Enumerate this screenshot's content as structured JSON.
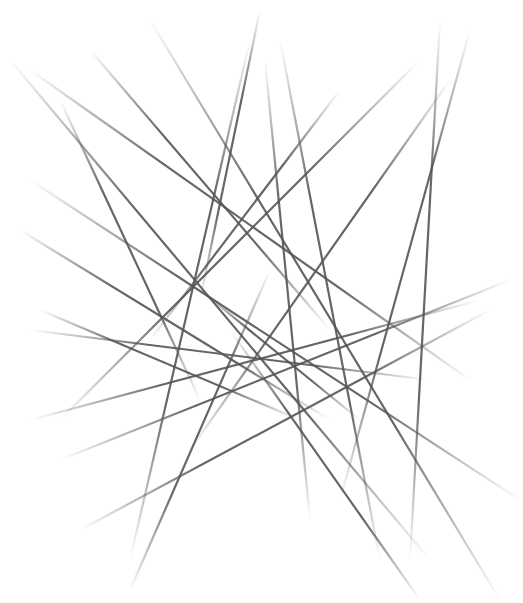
{
  "artwork": {
    "description": "Abstract crossing lines",
    "background": "#ffffff",
    "stroke_color": "#555555",
    "stroke_width": 2.2,
    "lines": [
      {
        "x1": 10,
        "y1": 60,
        "x2": 430,
        "y2": 560,
        "fade": "both"
      },
      {
        "x1": 60,
        "y1": 100,
        "x2": 200,
        "y2": 400,
        "fade": "both"
      },
      {
        "x1": 30,
        "y1": 70,
        "x2": 470,
        "y2": 380,
        "fade": "both"
      },
      {
        "x1": 150,
        "y1": 20,
        "x2": 500,
        "y2": 600,
        "fade": "both"
      },
      {
        "x1": 90,
        "y1": 50,
        "x2": 330,
        "y2": 330,
        "fade": "both"
      },
      {
        "x1": 250,
        "y1": 40,
        "x2": 130,
        "y2": 560,
        "fade": "both"
      },
      {
        "x1": 260,
        "y1": 10,
        "x2": 200,
        "y2": 300,
        "fade": "both"
      },
      {
        "x1": 280,
        "y1": 40,
        "x2": 380,
        "y2": 560,
        "fade": "both"
      },
      {
        "x1": 265,
        "y1": 60,
        "x2": 310,
        "y2": 520,
        "fade": "both"
      },
      {
        "x1": 440,
        "y1": 20,
        "x2": 410,
        "y2": 560,
        "fade": "both"
      },
      {
        "x1": 470,
        "y1": 30,
        "x2": 340,
        "y2": 500,
        "fade": "both"
      },
      {
        "x1": 450,
        "y1": 80,
        "x2": 190,
        "y2": 450,
        "fade": "both"
      },
      {
        "x1": 420,
        "y1": 60,
        "x2": 60,
        "y2": 420,
        "fade": "both"
      },
      {
        "x1": 340,
        "y1": 90,
        "x2": 150,
        "y2": 340,
        "fade": "both"
      },
      {
        "x1": 30,
        "y1": 330,
        "x2": 430,
        "y2": 380,
        "fade": "both"
      },
      {
        "x1": 30,
        "y1": 420,
        "x2": 480,
        "y2": 300,
        "fade": "both"
      },
      {
        "x1": 60,
        "y1": 460,
        "x2": 510,
        "y2": 280,
        "fade": "both"
      },
      {
        "x1": 80,
        "y1": 530,
        "x2": 490,
        "y2": 310,
        "fade": "both"
      },
      {
        "x1": 20,
        "y1": 230,
        "x2": 330,
        "y2": 420,
        "fade": "both"
      },
      {
        "x1": 30,
        "y1": 180,
        "x2": 520,
        "y2": 500,
        "fade": "both"
      },
      {
        "x1": 40,
        "y1": 310,
        "x2": 300,
        "y2": 420,
        "fade": "both"
      },
      {
        "x1": 270,
        "y1": 270,
        "x2": 130,
        "y2": 590,
        "fade": "both"
      },
      {
        "x1": 230,
        "y1": 330,
        "x2": 420,
        "y2": 600,
        "fade": "both"
      },
      {
        "x1": 200,
        "y1": 290,
        "x2": 360,
        "y2": 420,
        "fade": "both"
      }
    ]
  }
}
